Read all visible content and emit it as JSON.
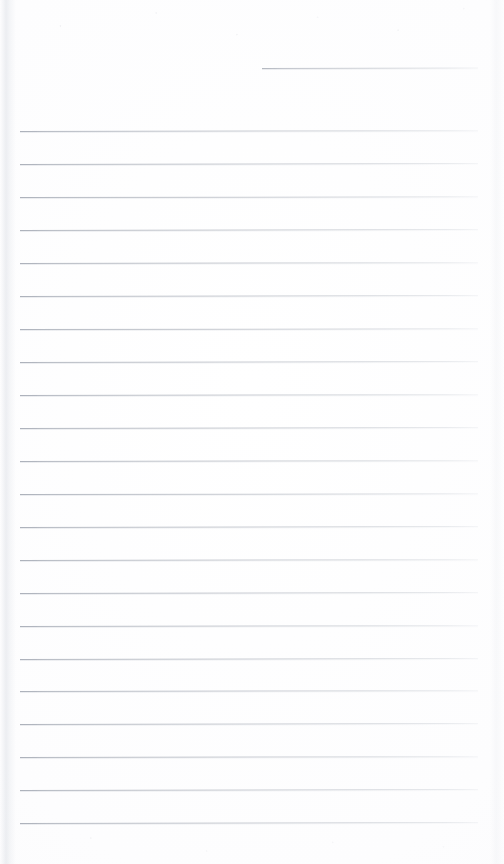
{
  "document": {
    "kind": "blank-lined-writing-page",
    "title": "Blank Lined Page",
    "page_width": 504,
    "page_height": 864,
    "background_color": "#fdfdfe",
    "rule_color": "#b9bdc5",
    "rule_color_dark_end": "#a8adb7",
    "has_text_content": false,
    "text_content": "",
    "note": ""
  },
  "header_rule": {
    "name": "header-blank-rule",
    "x": 262,
    "y": 68,
    "width": 216,
    "thickness": 1,
    "skew_deg": -0.12,
    "label": ""
  },
  "ruled_area": {
    "left": 20,
    "right": 478,
    "width": 458,
    "first_line_y": 131,
    "last_line_y": 823,
    "line_spacing": 32.95,
    "line_count": 22,
    "thickness": 1,
    "lines": [
      {
        "index": 1,
        "y": 131,
        "skew_deg": -0.1
      },
      {
        "index": 2,
        "y": 164,
        "skew_deg": -0.11
      },
      {
        "index": 3,
        "y": 197,
        "skew_deg": -0.09
      },
      {
        "index": 4,
        "y": 230,
        "skew_deg": -0.12
      },
      {
        "index": 5,
        "y": 263,
        "skew_deg": -0.1
      },
      {
        "index": 6,
        "y": 296,
        "skew_deg": -0.11
      },
      {
        "index": 7,
        "y": 329,
        "skew_deg": -0.09
      },
      {
        "index": 8,
        "y": 362,
        "skew_deg": -0.12
      },
      {
        "index": 9,
        "y": 395,
        "skew_deg": -0.1
      },
      {
        "index": 10,
        "y": 428,
        "skew_deg": -0.11
      },
      {
        "index": 11,
        "y": 461,
        "skew_deg": -0.1
      },
      {
        "index": 12,
        "y": 494,
        "skew_deg": -0.09
      },
      {
        "index": 13,
        "y": 527,
        "skew_deg": -0.12
      },
      {
        "index": 14,
        "y": 560,
        "skew_deg": -0.1
      },
      {
        "index": 15,
        "y": 593,
        "skew_deg": -0.11
      },
      {
        "index": 16,
        "y": 626,
        "skew_deg": -0.1
      },
      {
        "index": 17,
        "y": 659,
        "skew_deg": -0.12
      },
      {
        "index": 18,
        "y": 691,
        "skew_deg": -0.1
      },
      {
        "index": 19,
        "y": 724,
        "skew_deg": -0.11
      },
      {
        "index": 20,
        "y": 757,
        "skew_deg": -0.1
      },
      {
        "index": 21,
        "y": 790,
        "skew_deg": -0.12
      },
      {
        "index": 22,
        "y": 823,
        "skew_deg": -0.11
      }
    ]
  },
  "margins": {
    "top_blank_height": 131,
    "bottom_blank_height": 41,
    "left_edge_shadow": true,
    "right_edge_shadow": true
  }
}
